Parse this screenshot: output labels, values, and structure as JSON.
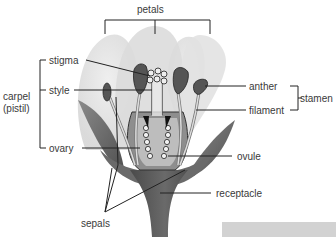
{
  "diagram": {
    "labels": {
      "petals": "petals",
      "stigma": "stigma",
      "style": "style",
      "carpel": "carpel",
      "pistil": "(pistil)",
      "ovary": "ovary",
      "anther": "anther",
      "filament": "filament",
      "stamen": "stamen",
      "ovule": "ovule",
      "receptacle": "receptacle",
      "sepals": "sepals"
    },
    "groups": [
      {
        "name": "carpel (pistil)",
        "members": [
          "stigma",
          "style",
          "ovary"
        ]
      },
      {
        "name": "stamen",
        "members": [
          "anther",
          "filament"
        ]
      }
    ],
    "colors": {
      "petal_light": "#e6e6e6",
      "petal_mid": "#d6d6d6",
      "sepal": "#6e6e6e",
      "stem": "#5a5a5a",
      "leader_line": "#222222",
      "label_text": "#3a3a3a",
      "anther": "#555555",
      "ovule": "#f0f0f0"
    }
  }
}
